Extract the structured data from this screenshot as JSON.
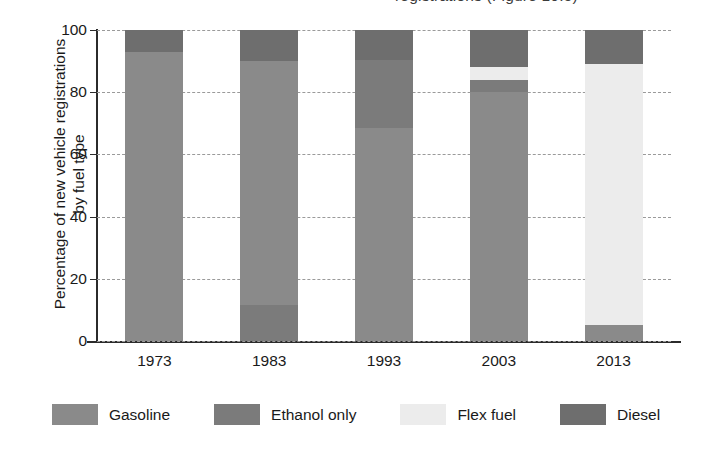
{
  "caption": {
    "text": "registrations (Figure 10.5)"
  },
  "chart_data": {
    "type": "bar",
    "subtype": "stacked-bar-percentage",
    "title": "",
    "xlabel": "",
    "ylabel": "Percentage of new vehicle registrations by fuel type",
    "ylabel_line1": "Percentage of new vehicle registrations",
    "ylabel_line2": "by fuel type",
    "categories": [
      "1973",
      "1983",
      "1993",
      "2003",
      "2013"
    ],
    "ylim": [
      0,
      100
    ],
    "yticks": [
      0,
      20,
      40,
      60,
      80,
      100
    ],
    "ytick_labels": [
      "0",
      "20",
      "40",
      "60",
      "80",
      "100"
    ],
    "grid": true,
    "grid_style": "dashed-horizontal",
    "legend_position": "bottom",
    "stack_order_bottom_to_top": [
      "Ethanol only",
      "Gasoline",
      "Flex fuel",
      "Diesel"
    ],
    "series": [
      {
        "name": "Gasoline",
        "color": "#8a8a8a",
        "values": [
          93,
          78.5,
          68.5,
          80,
          5
        ]
      },
      {
        "name": "Ethanol only",
        "color": "#7b7b7b",
        "values": [
          0,
          11.5,
          22,
          4,
          0
        ]
      },
      {
        "name": "Flex fuel",
        "color": "#ececec",
        "values": [
          0,
          0,
          0,
          4,
          84
        ]
      },
      {
        "name": "Diesel",
        "color": "#6e6e6e",
        "values": [
          7,
          10,
          9.5,
          12,
          11
        ]
      }
    ],
    "bars": [
      {
        "category": "1973",
        "segments": [
          {
            "name": "Gasoline",
            "start": 0,
            "end": 93,
            "value": 93
          },
          {
            "name": "Diesel",
            "start": 93,
            "end": 100,
            "value": 7
          }
        ]
      },
      {
        "category": "1983",
        "segments": [
          {
            "name": "Ethanol only",
            "start": 0,
            "end": 11.5,
            "value": 11.5
          },
          {
            "name": "Gasoline",
            "start": 11.5,
            "end": 90,
            "value": 78.5
          },
          {
            "name": "Diesel",
            "start": 90,
            "end": 100,
            "value": 10
          }
        ]
      },
      {
        "category": "1993",
        "segments": [
          {
            "name": "Gasoline",
            "start": 0,
            "end": 68.5,
            "value": 68.5
          },
          {
            "name": "Ethanol only",
            "start": 68.5,
            "end": 90.5,
            "value": 22
          },
          {
            "name": "Diesel",
            "start": 90.5,
            "end": 100,
            "value": 9.5
          }
        ]
      },
      {
        "category": "2003",
        "segments": [
          {
            "name": "Gasoline",
            "start": 0,
            "end": 80,
            "value": 80
          },
          {
            "name": "Ethanol only",
            "start": 80,
            "end": 84,
            "value": 4
          },
          {
            "name": "Flex fuel",
            "start": 84,
            "end": 88,
            "value": 4
          },
          {
            "name": "Diesel",
            "start": 88,
            "end": 100,
            "value": 12
          }
        ]
      },
      {
        "category": "2013",
        "segments": [
          {
            "name": "Gasoline",
            "start": 0,
            "end": 5,
            "value": 5
          },
          {
            "name": "Flex fuel",
            "start": 5,
            "end": 89,
            "value": 84
          },
          {
            "name": "Diesel",
            "start": 89,
            "end": 100,
            "value": 11
          }
        ]
      }
    ],
    "legend": [
      {
        "label": "Gasoline",
        "color": "#8a8a8a"
      },
      {
        "label": "Ethanol only",
        "color": "#7b7b7b"
      },
      {
        "label": "Flex fuel",
        "color": "#ececec"
      },
      {
        "label": "Diesel",
        "color": "#6e6e6e"
      }
    ]
  },
  "colors": {
    "axis": "#2b2b2b",
    "grid": "#9a9a9a",
    "background": "#ffffff",
    "text": "#1a1a1a"
  }
}
